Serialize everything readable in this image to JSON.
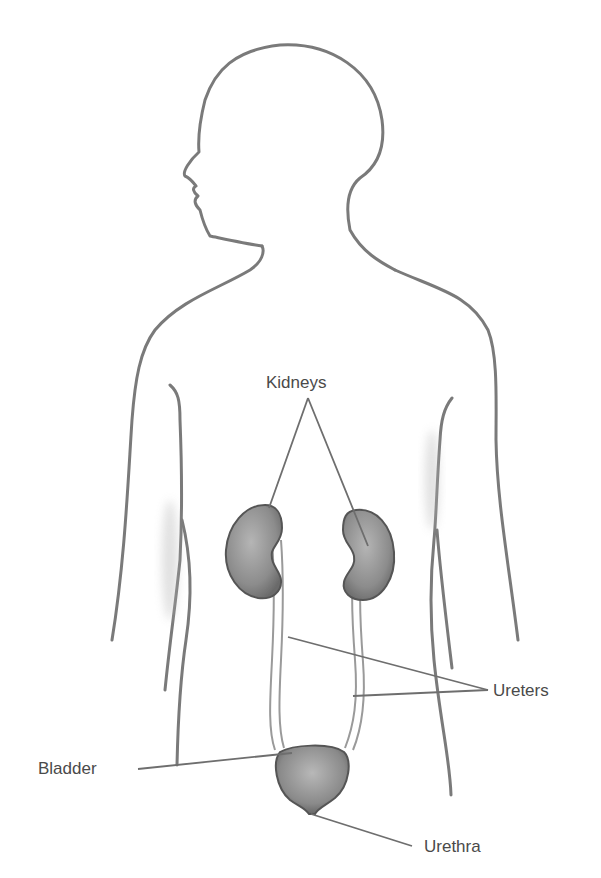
{
  "diagram": {
    "labels": {
      "kidneys": "Kidneys",
      "ureters": "Ureters",
      "bladder": "Bladder",
      "urethra": "Urethra"
    },
    "colors": {
      "outline": "#7a7a7a",
      "organ_fill": "#8a8a8a",
      "organ_edge": "#555555",
      "leader_line": "#6e6e6e",
      "label_text": "#4a4a4a",
      "background": "#ffffff"
    }
  }
}
